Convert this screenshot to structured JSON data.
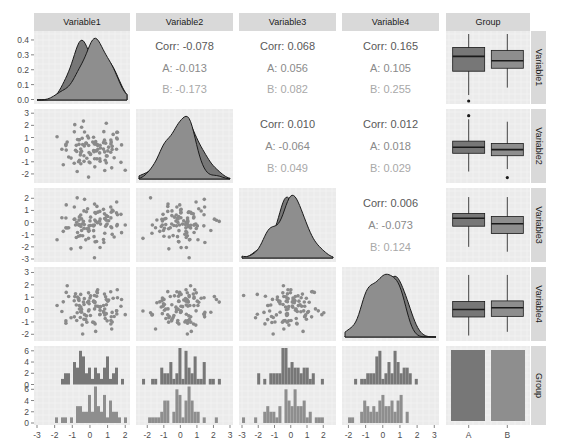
{
  "colors": {
    "panel_bg": "#ebebeb",
    "grid_major": "#ffffff",
    "grid_minor": "#f5f5f5",
    "strip_bg": "#d9d9d9",
    "group_A": "#777777",
    "group_B": "#8e8e8e",
    "points": "#8a8a8a",
    "outline": "#1a1a1a"
  },
  "variables": [
    "Variable1",
    "Variable2",
    "Variable3",
    "Variable4",
    "Group"
  ],
  "columns": [
    {
      "label": "Variable1",
      "x0": 34,
      "x1": 130
    },
    {
      "label": "Variable2",
      "x0": 136,
      "x1": 233
    },
    {
      "label": "Variable3",
      "x0": 239,
      "x1": 336
    },
    {
      "label": "Variable4",
      "x0": 342,
      "x1": 439
    },
    {
      "label": "Group",
      "x0": 446,
      "x1": 530
    }
  ],
  "rows": [
    {
      "label": "Variable1",
      "y0": 31,
      "y1": 104
    },
    {
      "label": "Variable2",
      "y0": 109,
      "y1": 183
    },
    {
      "label": "Variable3",
      "y0": 188,
      "y1": 262
    },
    {
      "label": "Variable4",
      "y0": 267,
      "y1": 341
    },
    {
      "label": "Group",
      "y0": 346,
      "y1": 425
    }
  ],
  "strip_top": {
    "y0": 13,
    "y1": 31
  },
  "strip_right": {
    "x0": 531,
    "x1": 546
  },
  "x_ticks": {
    "Variable1": {
      "range": [
        -3,
        2.1
      ],
      "ticks": [
        -3,
        -2,
        -1,
        0,
        1,
        2
      ]
    },
    "Variable2": {
      "range": [
        -2.5,
        3.0
      ],
      "ticks": [
        -2,
        -1,
        0,
        1,
        2,
        3
      ]
    },
    "Variable3": {
      "range": [
        -3,
        2.6
      ],
      "ticks": [
        -3,
        -2,
        -1,
        0,
        1,
        2
      ]
    },
    "Variable4": {
      "range": [
        -2.2,
        3.1
      ],
      "ticks": [
        -2,
        -1,
        0,
        1,
        2,
        3
      ]
    },
    "Group": {
      "ticks": [
        "A",
        "B"
      ]
    }
  },
  "y_ticks": {
    "Variable1": {
      "range": [
        -0.01,
        0.44
      ],
      "ticks": [
        "0.0",
        "0.1",
        "0.2",
        "0.3",
        "0.4"
      ],
      "values": [
        0,
        0.1,
        0.2,
        0.3,
        0.4
      ]
    },
    "Variable2": {
      "range": [
        -2.5,
        3.1
      ],
      "ticks": [
        "-2",
        "-1",
        "0",
        "1",
        "2",
        "3"
      ],
      "values": [
        -2,
        -1,
        0,
        1,
        2,
        3
      ]
    },
    "Variable3": {
      "range": [
        -3,
        2.6
      ],
      "ticks": [
        "-3",
        "-2",
        "-1",
        "0",
        "1",
        "2"
      ],
      "values": [
        -3,
        -2,
        -1,
        0,
        1,
        2
      ]
    },
    "Variable4": {
      "range": [
        -2.3,
        3.2
      ],
      "ticks": [
        "-2",
        "-1",
        "0",
        "1",
        "2",
        "3"
      ],
      "values": [
        -2,
        -1,
        0,
        1,
        2,
        3
      ]
    },
    "Group": {
      "ticks": [
        "0",
        "2",
        "4",
        "6",
        "0",
        "2",
        "4",
        "6"
      ]
    }
  },
  "correlations": [
    {
      "row": 0,
      "col": 1,
      "corr": "Corr: -0.078",
      "A": "A: -0.013",
      "B": "B: -0.173"
    },
    {
      "row": 0,
      "col": 2,
      "corr": "Corr: 0.068",
      "A": "A: 0.056",
      "B": "B: 0.082"
    },
    {
      "row": 0,
      "col": 3,
      "corr": "Corr: 0.165",
      "A": "A: 0.105",
      "B": "B: 0.255"
    },
    {
      "row": 1,
      "col": 2,
      "corr": "Corr: 0.010",
      "A": "A: -0.064",
      "B": "B: 0.049"
    },
    {
      "row": 1,
      "col": 3,
      "corr": "Corr: 0.012",
      "A": "A: 0.018",
      "B": "B: 0.029"
    },
    {
      "row": 2,
      "col": 3,
      "corr": "Corr: 0.006",
      "A": "A: -0.073",
      "B": "B: 0.124"
    }
  ],
  "chart_data": {
    "type": "scatter",
    "title": "",
    "groups": [
      "A",
      "B"
    ],
    "correlations": {
      "Variable1-Variable2": {
        "overall": -0.078,
        "A": -0.013,
        "B": -0.173
      },
      "Variable1-Variable3": {
        "overall": 0.068,
        "A": 0.056,
        "B": 0.082
      },
      "Variable1-Variable4": {
        "overall": 0.165,
        "A": 0.105,
        "B": 0.255
      },
      "Variable2-Variable3": {
        "overall": 0.01,
        "A": -0.064,
        "B": 0.049
      },
      "Variable2-Variable4": {
        "overall": 0.012,
        "A": 0.018,
        "B": 0.029
      },
      "Variable3-Variable4": {
        "overall": 0.006,
        "A": -0.073,
        "B": 0.124
      }
    },
    "boxplots": {
      "Variable1": {
        "A": {
          "q1": 0.19,
          "median": 0.29,
          "q3": 0.35,
          "lo": 0.03,
          "hi": 0.44,
          "outliers": [
            -0.03
          ]
        },
        "B": {
          "q1": 0.21,
          "median": 0.26,
          "q3": 0.33,
          "lo": 0.08,
          "hi": 0.44,
          "outliers": []
        }
      },
      "Variable2": {
        "A": {
          "q1": -0.3,
          "median": 0.2,
          "q3": 0.7,
          "lo": -1.8,
          "hi": 2.5,
          "outliers": [
            2.8
          ]
        },
        "B": {
          "q1": -0.5,
          "median": 0.0,
          "q3": 0.5,
          "lo": -1.6,
          "hi": 2.3,
          "outliers": [
            -2.3
          ]
        }
      },
      "Variable3": {
        "A": {
          "q1": -0.3,
          "median": 0.35,
          "q3": 0.75,
          "lo": -2.0,
          "hi": 2.1,
          "outliers": []
        },
        "B": {
          "q1": -0.9,
          "median": -0.1,
          "q3": 0.5,
          "lo": -2.4,
          "hi": 2.1,
          "outliers": []
        }
      },
      "Variable4": {
        "A": {
          "q1": -0.6,
          "median": 0.0,
          "q3": 0.65,
          "lo": -2.1,
          "hi": 2.8,
          "outliers": []
        },
        "B": {
          "q1": -0.55,
          "median": 0.15,
          "q3": 0.7,
          "lo": -1.8,
          "hi": 2.8,
          "outliers": []
        }
      }
    },
    "group_counts": {
      "A": 50,
      "B": 50
    },
    "xlabel": "",
    "ylabel": ""
  }
}
